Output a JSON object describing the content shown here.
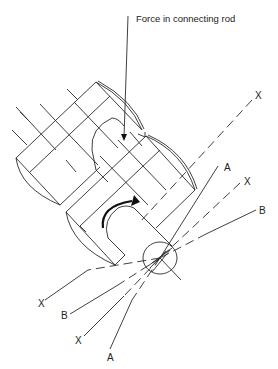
{
  "diagram": {
    "callout": {
      "text": "Force in connecting rod",
      "icon": "arrow-down-icon"
    },
    "rotation_indicator": {
      "icon": "curved-arrow-clockwise-icon"
    },
    "axis_labels": {
      "x_top_right": "X",
      "a_upper": "A",
      "x_upper": "X",
      "b_upper": "B",
      "x_left": "X",
      "b_lower": "B",
      "x_lower": "X",
      "a_lower": "A"
    },
    "colors": {
      "line": "#2a2a2a",
      "background": "#ffffff"
    }
  }
}
